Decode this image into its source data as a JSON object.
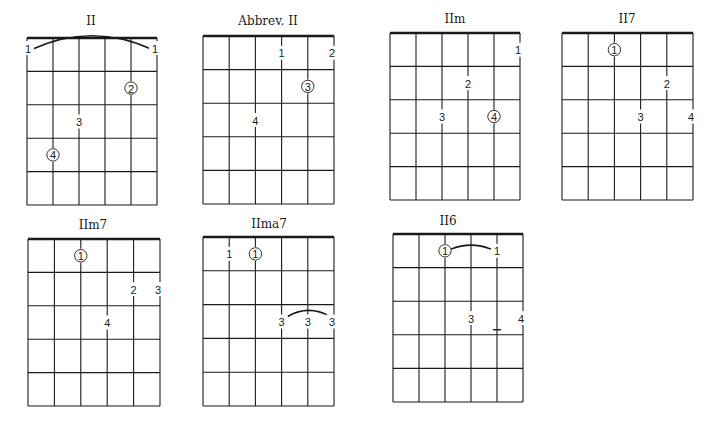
{
  "style": {
    "ink": "#1a1a1a",
    "background": "#ffffff"
  },
  "chords": [
    {
      "id": "II",
      "title": "II",
      "box": {
        "x": 27,
        "y": 38,
        "w": 130,
        "h": 167
      },
      "title_pos": {
        "x": 91,
        "y": 14
      },
      "labels": [
        {
          "text": "1",
          "string": 0,
          "fret": 0.3,
          "dx": 0,
          "circled": false
        },
        {
          "text": "1",
          "string": 5,
          "fret": 0.3,
          "dx": 0,
          "circled": false
        },
        {
          "text": "2",
          "string": 4,
          "fret": 1.5,
          "dx": 0,
          "circled": true
        },
        {
          "text": "3",
          "string": 2,
          "fret": 2.5,
          "dx": 0,
          "circled": false
        },
        {
          "text": "4",
          "string": 1,
          "fret": 3.5,
          "dx": 0,
          "circled": true
        }
      ],
      "arcs": [
        {
          "from_string": 0,
          "to_string": 5,
          "fret": 0.35,
          "rise": 14
        }
      ],
      "ticks": []
    },
    {
      "id": "Abbrev II",
      "title": "Abbrev. II",
      "box": {
        "x": 203,
        "y": 36,
        "w": 131,
        "h": 168
      },
      "title_pos": {
        "x": 268,
        "y": 14
      },
      "labels": [
        {
          "text": "1",
          "string": 3,
          "fret": 0.5,
          "dx": 0,
          "circled": false
        },
        {
          "text": "2",
          "string": 5,
          "fret": 0.5,
          "dx": 0,
          "circled": false
        },
        {
          "text": "3",
          "string": 4,
          "fret": 1.5,
          "dx": 0,
          "circled": true
        },
        {
          "text": "4",
          "string": 2,
          "fret": 2.5,
          "dx": 0,
          "circled": false
        }
      ],
      "arcs": [],
      "ticks": []
    },
    {
      "id": "IIm",
      "title": "IIm",
      "box": {
        "x": 390,
        "y": 33,
        "w": 130,
        "h": 167
      },
      "title_pos": {
        "x": 455,
        "y": 12
      },
      "labels": [
        {
          "text": "1",
          "string": 5,
          "fret": 0.5,
          "dx": 0,
          "circled": false
        },
        {
          "text": "2",
          "string": 3,
          "fret": 1.5,
          "dx": 0,
          "circled": false
        },
        {
          "text": "3",
          "string": 2,
          "fret": 2.5,
          "dx": 0,
          "circled": false
        },
        {
          "text": "4",
          "string": 4,
          "fret": 2.5,
          "dx": 0,
          "circled": true
        }
      ],
      "arcs": [],
      "ticks": []
    },
    {
      "id": "II7",
      "title": "II7",
      "box": {
        "x": 562,
        "y": 33,
        "w": 131,
        "h": 167
      },
      "title_pos": {
        "x": 627,
        "y": 12
      },
      "labels": [
        {
          "text": "1",
          "string": 2,
          "fret": 0.5,
          "dx": 0,
          "circled": true
        },
        {
          "text": "2",
          "string": 4,
          "fret": 1.5,
          "dx": 0,
          "circled": false
        },
        {
          "text": "3",
          "string": 3,
          "fret": 2.5,
          "dx": 0,
          "circled": false
        },
        {
          "text": "4",
          "string": 5,
          "fret": 2.5,
          "dx": 0,
          "circled": false
        }
      ],
      "arcs": [],
      "ticks": []
    },
    {
      "id": "IIm7",
      "title": "IIm7",
      "box": {
        "x": 28,
        "y": 239,
        "w": 132,
        "h": 167
      },
      "title_pos": {
        "x": 93,
        "y": 218
      },
      "labels": [
        {
          "text": "1",
          "string": 2,
          "fret": 0.5,
          "dx": 0,
          "circled": true
        },
        {
          "text": "2",
          "string": 4,
          "fret": 1.5,
          "dx": 0,
          "circled": false
        },
        {
          "text": "3",
          "string": 5,
          "fret": 1.5,
          "dx": 0,
          "circled": false
        },
        {
          "text": "4",
          "string": 3,
          "fret": 2.5,
          "dx": 0,
          "circled": false
        }
      ],
      "arcs": [],
      "ticks": []
    },
    {
      "id": "IIma7",
      "title": "IIma7",
      "box": {
        "x": 203,
        "y": 237,
        "w": 131,
        "h": 169
      },
      "title_pos": {
        "x": 269,
        "y": 217
      },
      "labels": [
        {
          "text": "1",
          "string": 1,
          "fret": 0.5,
          "dx": 0,
          "circled": false
        },
        {
          "text": "1",
          "string": 2,
          "fret": 0.5,
          "dx": 0,
          "circled": true
        },
        {
          "text": "3",
          "string": 3,
          "fret": 2.5,
          "dx": 0,
          "circled": false
        },
        {
          "text": "3",
          "string": 4,
          "fret": 2.5,
          "dx": 0,
          "circled": false
        },
        {
          "text": "3",
          "string": 5,
          "fret": 2.5,
          "dx": 0,
          "circled": false
        }
      ],
      "arcs": [
        {
          "from_string": 3,
          "to_string": 5,
          "fret": 2.35,
          "rise": 6
        }
      ],
      "ticks": []
    },
    {
      "id": "II6",
      "title": "II6",
      "box": {
        "x": 393,
        "y": 234,
        "w": 130,
        "h": 168
      },
      "title_pos": {
        "x": 448,
        "y": 214
      },
      "labels": [
        {
          "text": "1",
          "string": 2,
          "fret": 0.5,
          "dx": 0,
          "circled": true
        },
        {
          "text": "1",
          "string": 4,
          "fret": 0.5,
          "dx": 0,
          "circled": false
        },
        {
          "text": "3",
          "string": 3,
          "fret": 2.5,
          "dx": 0,
          "circled": false
        },
        {
          "text": "4",
          "string": 5,
          "fret": 2.5,
          "dx": 0,
          "circled": false
        }
      ],
      "arcs": [
        {
          "from_string": 2,
          "to_string": 4,
          "fret": 0.45,
          "rise": 4
        }
      ],
      "ticks": [
        {
          "string": 4,
          "fret": 2.85
        }
      ]
    }
  ]
}
